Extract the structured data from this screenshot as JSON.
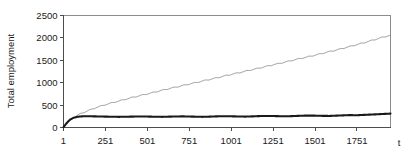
{
  "chart_data": {
    "type": "line",
    "title": "",
    "xlabel": "t",
    "ylabel": "Total employment",
    "xlim": [
      1,
      1951
    ],
    "ylim": [
      0,
      2500
    ],
    "grid": false,
    "legend": false,
    "x_ticks": [
      1,
      251,
      501,
      751,
      1001,
      1251,
      1501,
      1751
    ],
    "x_tick_labels": [
      "1",
      "251",
      "501",
      "751",
      "1001",
      "1251",
      "1501",
      "1751"
    ],
    "y_ticks": [
      0,
      500,
      1000,
      1500,
      2000,
      2500
    ],
    "y_tick_labels": [
      "0",
      "500",
      "1000",
      "1500",
      "2000",
      "2500"
    ],
    "series": [
      {
        "name": "upper-trend",
        "color": "#8f8f8f",
        "width": 0.9,
        "note": "thin grey line rising near-linearly with a small regular sawtooth ripple",
        "x": [
          1,
          20,
          45,
          75,
          110,
          150,
          200,
          251,
          300,
          350,
          400,
          450,
          501,
          550,
          600,
          650,
          700,
          751,
          800,
          850,
          900,
          950,
          1001,
          1050,
          1100,
          1150,
          1200,
          1251,
          1300,
          1350,
          1400,
          1450,
          1501,
          1550,
          1600,
          1650,
          1700,
          1751,
          1800,
          1850,
          1900,
          1951
        ],
        "y": [
          10,
          95,
          180,
          255,
          320,
          380,
          450,
          510,
          560,
          610,
          660,
          705,
          750,
          795,
          840,
          885,
          925,
          970,
          1010,
          1055,
          1095,
          1140,
          1185,
          1225,
          1270,
          1310,
          1355,
          1400,
          1440,
          1485,
          1530,
          1570,
          1615,
          1660,
          1705,
          1750,
          1800,
          1850,
          1900,
          1955,
          2010,
          2060
        ],
        "ripple_amplitude": 22,
        "ripple_period": 62
      },
      {
        "name": "lower-trend",
        "color": "#1a1a1a",
        "width": 2.1,
        "note": "thick black line rising steeply then plateauing around 250-330 with small wobbles",
        "x": [
          1,
          12,
          25,
          40,
          60,
          85,
          115,
          150,
          190,
          230,
          251,
          290,
          330,
          370,
          410,
          450,
          501,
          545,
          590,
          630,
          670,
          710,
          751,
          790,
          830,
          870,
          910,
          950,
          1001,
          1045,
          1085,
          1125,
          1165,
          1205,
          1251,
          1295,
          1335,
          1375,
          1415,
          1455,
          1501,
          1545,
          1585,
          1625,
          1665,
          1705,
          1751,
          1795,
          1840,
          1885,
          1925,
          1951
        ],
        "y": [
          8,
          60,
          120,
          175,
          215,
          240,
          250,
          252,
          248,
          245,
          243,
          240,
          238,
          240,
          243,
          246,
          244,
          240,
          238,
          242,
          246,
          248,
          245,
          241,
          238,
          242,
          248,
          252,
          250,
          246,
          243,
          248,
          254,
          258,
          256,
          252,
          250,
          256,
          262,
          266,
          264,
          260,
          258,
          264,
          270,
          276,
          274,
          282,
          290,
          298,
          305,
          310
        ]
      }
    ]
  }
}
